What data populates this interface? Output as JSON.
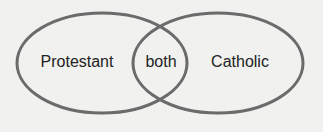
{
  "diagram": {
    "type": "venn",
    "stroke_color": "#6b6b6b",
    "background_color": "#f1f1ef",
    "text_color": "#222222",
    "sets": [
      {
        "id": "left",
        "label": "Protestant"
      },
      {
        "id": "right",
        "label": "Catholic"
      }
    ],
    "intersection": {
      "label": "both"
    }
  }
}
